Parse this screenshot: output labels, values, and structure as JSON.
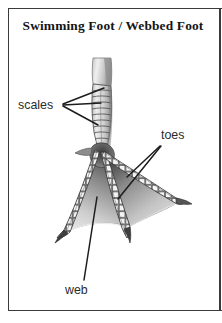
{
  "figure": {
    "title": "Swimming Foot / Webbed Foot",
    "style": "black-and-white engraved / halftone scientific illustration",
    "border_color": "#3a3a3a",
    "background_color": "#ffffff",
    "ink_color": "#141414"
  },
  "labels": {
    "scales": "scales",
    "toes": "toes",
    "web": "web"
  },
  "callouts": [
    {
      "name": "scales",
      "text": "scales",
      "text_x": 18,
      "text_y": 98,
      "leader_origin": [
        64,
        105
      ],
      "leader_targets": [
        [
          104,
          88
        ],
        [
          102,
          103
        ],
        [
          99,
          124
        ]
      ]
    },
    {
      "name": "toes",
      "text": "toes",
      "text_x": 161,
      "text_y": 128,
      "leader_origin": [
        160,
        146
      ],
      "leader_targets": [
        [
          128,
          178
        ],
        [
          119,
          198
        ]
      ]
    },
    {
      "name": "web",
      "text": "web",
      "text_x": 65,
      "text_y": 283,
      "leader_origin": [
        84,
        281
      ],
      "leader_targets": [
        [
          96,
          198
        ]
      ]
    }
  ],
  "anatomy": {
    "parts": [
      "tarsus",
      "scales",
      "toes",
      "web",
      "claws",
      "ankle-joint"
    ],
    "toe_count": 3,
    "claw_count": 3,
    "scale_rows_on_tarsus": 12,
    "scale_rows_per_toe": 16
  },
  "palette": {
    "web_dark": "#5d5d5d",
    "web_light": "#d9d9d9",
    "leg_mid": "#9a9a9a",
    "leg_light": "#e2e2e2",
    "outline": "#2e2e2e",
    "scale_fill": "#f2f2f2"
  }
}
